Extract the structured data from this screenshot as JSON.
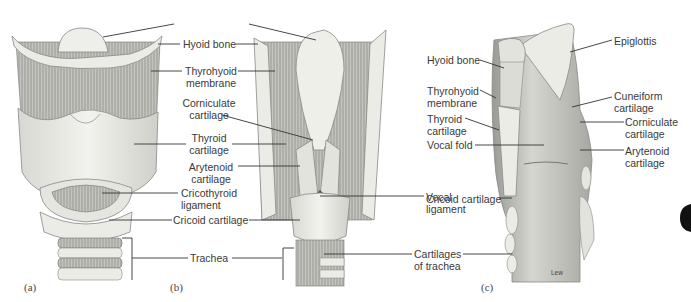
{
  "figure": {
    "panels": [
      {
        "id": "a",
        "label": "(a)",
        "view": "anterior"
      },
      {
        "id": "b",
        "label": "(b)",
        "view": "posterior"
      },
      {
        "id": "c",
        "label": "(c)",
        "view": "sagittal"
      }
    ],
    "labels_ab": {
      "epiglottis_pointer": "",
      "hyoid_bone": "Hyoid bone",
      "thyrohyoid_1": "Thyrohyoid",
      "thyrohyoid_2": "membrane",
      "corniculate_1": "Corniculate",
      "corniculate_2": "cartilage",
      "thyroid_1": "Thyroid",
      "thyroid_2": "cartilage",
      "arytenoid_1": "Arytenoid",
      "arytenoid_2": "cartilage",
      "cricothyroid_1": "Cricothyroid",
      "cricothyroid_2": "ligament",
      "cricoid": "Cricoid cartilage",
      "trachea": "Trachea",
      "vocal_lig_1": "Vocal",
      "vocal_lig_2": "ligament",
      "cart_trachea_1": "Cartilages",
      "cart_trachea_2": "of trachea"
    },
    "labels_c": {
      "epiglottis": "Epiglottis",
      "hyoid_bone": "Hyoid bone",
      "thyrohyoid_1": "Thyrohyoid",
      "thyrohyoid_2": "membrane",
      "thyroid_1": "Thyroid",
      "thyroid_2": "cartilage",
      "vocal_fold": "Vocal fold",
      "cricoid": "Cricoid cartilage",
      "cuneiform_1": "Cuneiform",
      "cuneiform_2": "cartilage",
      "corniculate_1": "Corniculate",
      "corniculate_2": "cartilage",
      "arytenoid_1": "Arytenoid",
      "arytenoid_2": "cartilage"
    },
    "credit": "Lew",
    "colors": {
      "cartilage": "#e9e9e4",
      "membrane": "#b9b9b4",
      "line": "#333333",
      "text": "#3a3a3a"
    }
  }
}
